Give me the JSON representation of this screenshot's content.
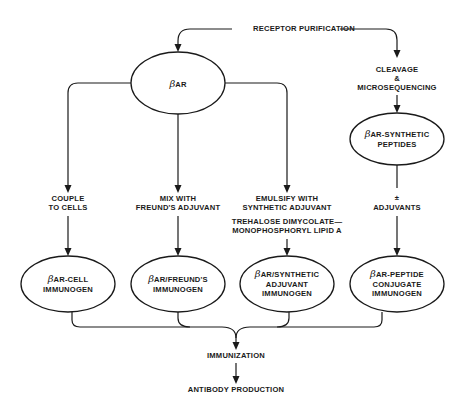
{
  "diagram": {
    "top_label": "RECEPTOR PURIFICATION",
    "root_node": {
      "beta": "β",
      "label": "AR"
    },
    "right_branch": {
      "step_lines": [
        "CLEAVAGE",
        "&",
        "MICROSEQUENCING"
      ],
      "node": {
        "beta": "β",
        "line1": "AR-SYNTHETIC",
        "line2": "PEPTIDES"
      },
      "after_lines": [
        "±",
        "ADJUVANTS"
      ]
    },
    "branches": [
      {
        "step_lines": [
          "COUPLE",
          "TO CELLS"
        ],
        "node": {
          "beta": "β",
          "line1": "AR-CELL",
          "line2": "IMMUNOGEN",
          "line3": ""
        }
      },
      {
        "step_lines": [
          "MIX WITH",
          "FREUND'S ADJUVANT"
        ],
        "node": {
          "beta": "β",
          "line1": "AR/FREUND'S",
          "line2": "IMMUNOGEN",
          "line3": ""
        }
      },
      {
        "step_lines": [
          "EMULSIFY WITH",
          "SYNTHETIC ADJUVANT",
          "TREHALOSE DIMYCOLATE—",
          "MONOPHOSPHORYL LIPID A"
        ],
        "node": {
          "beta": "β",
          "line1": "AR/SYNTHETIC",
          "line2": "ADJUVANT",
          "line3": "IMMUNOGEN"
        }
      },
      {
        "node": {
          "beta": "β",
          "line1": "AR-PEPTIDE",
          "line2": "CONJUGATE",
          "line3": "IMMUNOGEN"
        }
      }
    ],
    "merge_label": "IMMUNIZATION",
    "final_label": "ANTIBODY PRODUCTION"
  },
  "colors": {
    "ink": "#1a1a1a",
    "background": "#ffffff"
  }
}
